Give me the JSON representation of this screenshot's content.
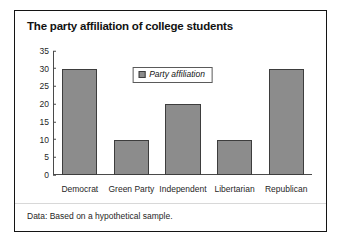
{
  "card": {
    "title": "The party affiliation of college students",
    "footnote": "Data: Based on a hypothetical sample."
  },
  "legend": {
    "label": "Party affiliation",
    "swatch_color": "#8c8c8c"
  },
  "chart_data": {
    "type": "bar",
    "title": "The party affiliation of college students",
    "categories": [
      "Democrat",
      "Green Party",
      "Independent",
      "Libertarian",
      "Republican"
    ],
    "values": [
      30,
      10,
      20,
      10,
      30
    ],
    "series": [
      {
        "name": "Party affiliation",
        "values": [
          30,
          10,
          20,
          10,
          30
        ],
        "color": "#8c8c8c"
      }
    ],
    "xlabel": "",
    "ylabel": "",
    "ylim": [
      0,
      35
    ],
    "ytick_step": 5,
    "yticks": [
      0,
      5,
      10,
      15,
      20,
      25,
      30,
      35
    ],
    "grid": false,
    "legend_position": "top-center",
    "annotation": "Data: Based on a hypothetical sample."
  }
}
